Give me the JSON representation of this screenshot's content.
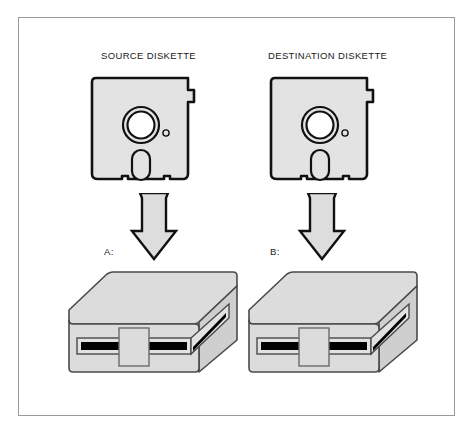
{
  "figure": {
    "background_color": "#ffffff",
    "border_color": "#9a9a9a",
    "fill_light": "#e3e3e3",
    "fill_mid": "#d4d4d4",
    "fill_dark": "#c4c4c4",
    "ink": "#111111",
    "slot_color": "#000000"
  },
  "labels": {
    "source": "SOURCE DISKETTE",
    "destination": "DESTINATION DISKETTE",
    "drive_a": "A:",
    "drive_b": "B:"
  },
  "diskettes": [
    {
      "id": "source-diskette",
      "label": "SOURCE DISKETTE",
      "features": [
        "hub-ring",
        "index-hole",
        "read-write-slot",
        "write-protect-notch",
        "bottom-notches"
      ]
    },
    {
      "id": "destination-diskette",
      "label": "DESTINATION DISKETTE",
      "features": [
        "hub-ring",
        "index-hole",
        "read-write-slot",
        "write-protect-notch",
        "bottom-notches"
      ]
    }
  ],
  "drives": [
    {
      "id": "drive-a",
      "label": "A:",
      "features": [
        "top-face",
        "front-face",
        "side-face",
        "media-slot",
        "door-latch"
      ]
    },
    {
      "id": "drive-b",
      "label": "B:",
      "features": [
        "top-face",
        "front-face",
        "side-face",
        "media-slot",
        "door-latch"
      ]
    }
  ],
  "arrows": [
    {
      "id": "arrow-a",
      "direction": "down",
      "from": "source-diskette",
      "to": "drive-a"
    },
    {
      "id": "arrow-b",
      "direction": "down",
      "from": "destination-diskette",
      "to": "drive-b"
    }
  ]
}
